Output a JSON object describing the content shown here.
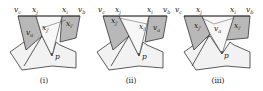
{
  "figure": {
    "panels": [
      {
        "caption": "(i)",
        "top_labels": {
          "left": "v",
          "left_sub": "c",
          "mid_left": "x",
          "mid_left_sub": "j",
          "mid_right": "x",
          "mid_right_sub": "i",
          "right": "v",
          "right_sub": "b"
        },
        "left_region_label": "v",
        "left_region_sub": "a",
        "right_region_label": "x",
        "right_region_sub": "i'",
        "inner_label": "x",
        "inner_sub": "j'",
        "point_label": "p"
      },
      {
        "caption": "(ii)",
        "top_labels": {
          "left": "v",
          "left_sub": "c",
          "mid_left": "x",
          "mid_left_sub": "j",
          "mid_right": "x",
          "mid_right_sub": "i",
          "right": "v",
          "right_sub": "b"
        },
        "left_region_label": "x",
        "left_region_sub": "j'",
        "right_region_label": "v",
        "right_region_sub": "a",
        "inner_label": "x",
        "inner_sub": "i'",
        "point_label": "p"
      },
      {
        "caption": "(iii)",
        "top_labels": {
          "left": "v",
          "left_sub": "c",
          "mid_left": "x",
          "mid_left_sub": "j",
          "mid_right": "x",
          "mid_right_sub": "i",
          "right": "v",
          "right_sub": "b"
        },
        "left_region_label": "x",
        "left_region_sub": "j'",
        "right_region_label": "x",
        "right_region_sub": "i'",
        "inner_label": "v",
        "inner_sub": "a",
        "point_label": "p"
      }
    ],
    "colors": {
      "shade": "#b8b8b8",
      "light": "#f2f2f2",
      "stroke": "#333333"
    }
  }
}
